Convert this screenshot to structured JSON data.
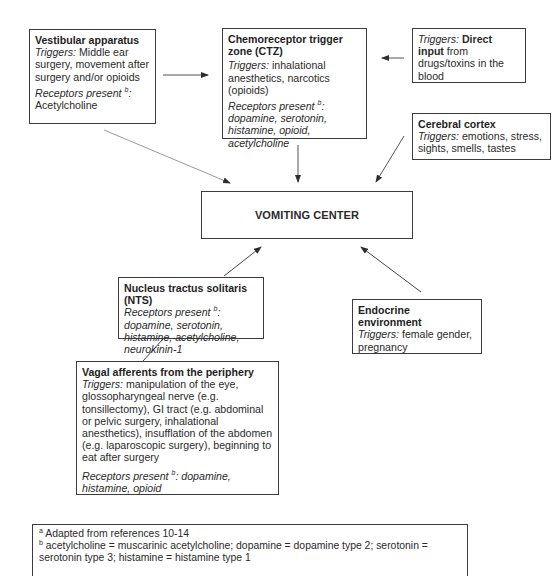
{
  "diagram": {
    "vestibular": {
      "title": "Vestibular apparatus",
      "triggers_label": "Triggers:",
      "triggers": " Middle ear surgery, movement after surgery and/or opioids",
      "receptors_label": "Receptors present ",
      "receptors_sup": "b",
      "receptors_colon": ":",
      "receptors": "Acetylcholine"
    },
    "ctz": {
      "title": "Chemoreceptor trigger zone (CTZ)",
      "triggers_label": "Triggers:",
      "triggers": " inhalational anesthetics, narcotics (opioids)",
      "receptors_label": "Receptors present ",
      "receptors_sup": "b",
      "receptors": ": dopamine, serotonin, histamine, opioid, acetylcholine"
    },
    "direct_input": {
      "triggers_label": "Triggers:",
      "title": " Direct input",
      "text": " from drugs/toxins in the blood"
    },
    "cerebral_cortex": {
      "title": "Cerebral cortex",
      "triggers_label": "Triggers:",
      "triggers": " emotions, stress, sights, smells, tastes"
    },
    "vomiting_center": {
      "title": "VOMITING CENTER"
    },
    "nts": {
      "title": "Nucleus tractus solitaris (NTS)",
      "receptors_label": "Receptors present ",
      "receptors_sup": "b",
      "receptors": ": dopamine, serotonin, histamine, acetylcholine, neurokinin-1"
    },
    "endocrine": {
      "title": "Endocrine environment",
      "triggers_label": "Triggers:",
      "triggers": " female gender, pregnancy"
    },
    "vagal": {
      "title": "Vagal afferents from the periphery",
      "triggers_label": "Triggers:",
      "triggers": " manipulation of the eye, glossopharyngeal nerve (e.g. tonsillectomy), GI tract (e.g. abdominal or pelvic surgery, inhalational anesthetics), insufflation of the abdomen (e.g. laparoscopic surgery), beginning to eat after surgery",
      "receptors_label": "Receptors present ",
      "receptors_sup": "b",
      "receptors": ": dopamine, histamine, opioid"
    },
    "footnotes": {
      "a_sup": "a",
      "a_text": " Adapted from references 10-14",
      "b_sup": "b",
      "b_text": " acetylcholine = muscarinic acetylcholine; dopamine = dopamine type 2; serotonin = serotonin type 3; histamine = histamine type 1"
    }
  },
  "colors": {
    "line": "#3c3c3c",
    "faint_line": "#9a9a9a",
    "text": "#2a2a2a"
  }
}
